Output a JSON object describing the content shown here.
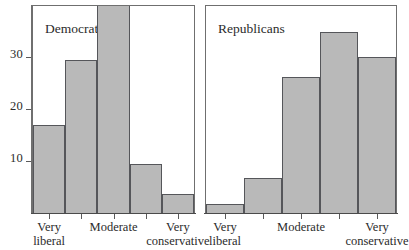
{
  "chart_data": {
    "type": "bar",
    "title": "",
    "xlabel": "",
    "ylabel": "",
    "ylim": [
      0,
      40
    ],
    "grid": false,
    "legend_position": "none",
    "panels": [
      {
        "name": "Democrats",
        "label": "Democrats",
        "categories": [
          "Very liberal",
          "Liberal",
          "Moderate",
          "Conservative",
          "Very conservative"
        ],
        "values": [
          17,
          29.4,
          40.5,
          9.4,
          3.7
        ],
        "tick_labels": [
          {
            "line1": "Very",
            "line2": "liberal"
          },
          {
            "line1": "",
            "line2": ""
          },
          {
            "line1": "Moderate",
            "line2": ""
          },
          {
            "line1": "",
            "line2": ""
          },
          {
            "line1": "Very",
            "line2": "conservative"
          }
        ]
      },
      {
        "name": "Republicans",
        "label": "Republicans",
        "categories": [
          "Very liberal",
          "Liberal",
          "Moderate",
          "Conservative",
          "Very conservative"
        ],
        "values": [
          1.7,
          6.7,
          26.2,
          34.8,
          30
        ],
        "tick_labels": [
          {
            "line1": "Very",
            "line2": "liberal"
          },
          {
            "line1": "",
            "line2": ""
          },
          {
            "line1": "Moderate",
            "line2": ""
          },
          {
            "line1": "",
            "line2": ""
          },
          {
            "line1": "Very",
            "line2": "conservative"
          }
        ]
      }
    ],
    "yticks": [
      10,
      20,
      30
    ],
    "ytick_labels": [
      "10",
      "20",
      "30"
    ],
    "colors": {
      "bar_fill": "#b9b9b9",
      "bar_edge": "#55565a",
      "axis": "#5a5a5a",
      "frame": "#6f6f6f",
      "text": "#2b2b2b",
      "background": "#ffffff"
    }
  },
  "axis": {
    "y_label_10": "10",
    "y_label_20": "20",
    "y_label_30": "30"
  },
  "panels": {
    "democrats": {
      "title": "Democrats",
      "x_tick_1_line1": "Very",
      "x_tick_1_line2": "liberal",
      "x_tick_3_line1": "Moderate",
      "x_tick_5_line1": "Very",
      "x_tick_5_line2": "conservative"
    },
    "republicans": {
      "title": "Republicans",
      "x_tick_1_line1": "Very",
      "x_tick_1_line2": "liberal",
      "x_tick_3_line1": "Moderate",
      "x_tick_5_line1": "Very",
      "x_tick_5_line2": "conservative"
    }
  }
}
